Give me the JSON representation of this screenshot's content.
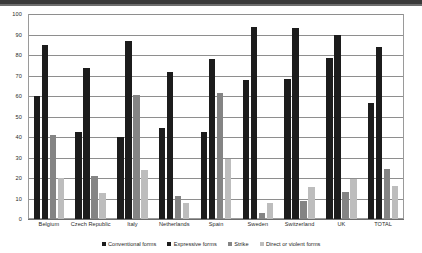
{
  "chart_data": {
    "type": "bar",
    "title": "",
    "subtitle": "",
    "xlabel": "",
    "ylabel": "",
    "ylim": [
      0,
      100
    ],
    "ytick_step": 10,
    "yticks": [
      0,
      10,
      20,
      30,
      40,
      50,
      60,
      70,
      80,
      90,
      100
    ],
    "grid": true,
    "legend_position": "bottom",
    "categories": [
      "Belgium",
      "Czech Republic",
      "Italy",
      "Netherlands",
      "Spain",
      "Sweden",
      "Switzerland",
      "UK",
      "TOTAL"
    ],
    "series": [
      {
        "name": "Conventional forms",
        "color": "#1c1c1c",
        "values": [
          60,
          42.5,
          40,
          44.5,
          42.5,
          68,
          68.5,
          78.5,
          56.5
        ]
      },
      {
        "name": "Expressive forms",
        "color": "#1c1c1c",
        "values": [
          85,
          73.5,
          87,
          71.5,
          78,
          93.5,
          93,
          90,
          84
        ]
      },
      {
        "name": "Strike",
        "color": "#848484",
        "values": [
          41,
          21,
          60.5,
          11,
          61.5,
          3,
          9,
          13,
          24.5
        ]
      },
      {
        "name": "Direct or violent forms",
        "color": "#bdbdbd",
        "values": [
          20,
          12.5,
          24,
          8,
          29.5,
          8,
          15.5,
          19.5,
          16
        ]
      }
    ]
  }
}
